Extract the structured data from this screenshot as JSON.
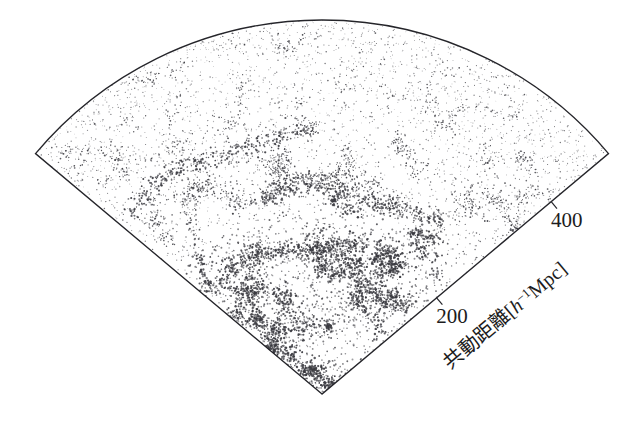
{
  "figure": {
    "name": "galaxy-redshift-survey-wedge",
    "background_color": "#ffffff",
    "ink_color": "#25252a",
    "dot_color": "#3a3a40"
  },
  "axis": {
    "title": "共動距離",
    "unit_open": "[",
    "unit_h": "h",
    "unit_exp": "−1",
    "unit_mpc": "Mpc",
    "unit_close": "]",
    "title_full": "共動距離[h−1Mpc]",
    "tick_labels": [
      "200",
      "400"
    ],
    "tick_values": [
      200,
      400
    ]
  },
  "chart_data": {
    "type": "scatter",
    "title": "共動距離[h−1Mpc]",
    "xlabel": "共動距離[h−1Mpc]",
    "ylabel": "",
    "projection": "polar-wedge",
    "radial_axis": {
      "label": "共動距離[h−1Mpc]",
      "unit": "h^-1 Mpc",
      "ticks": [
        200,
        400
      ],
      "tick_labels": [
        "200",
        "400"
      ],
      "range": [
        0,
        500
      ],
      "pixels_per_unit": 0.748
    },
    "angular_axis": {
      "half_angle_deg": 50,
      "range_deg": [
        -50,
        50
      ],
      "ticks": [],
      "tick_labels": []
    },
    "geometry": {
      "apex_x": 322,
      "apex_y": 394,
      "radius_px": 374,
      "left_corner": [
        33,
        164
      ],
      "right_corner": [
        608,
        163
      ],
      "arc_top_y": 20
    },
    "grid": false,
    "legend": null,
    "legend_position": "none",
    "point_count": 9000,
    "annotations": []
  }
}
